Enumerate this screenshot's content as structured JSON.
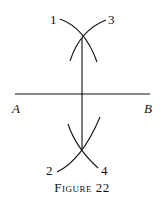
{
  "diagram": {
    "labels": {
      "p1": "1",
      "p3": "3",
      "p2": "2",
      "p4": "4",
      "A": "A",
      "B": "B"
    },
    "caption": "Figure 22"
  }
}
